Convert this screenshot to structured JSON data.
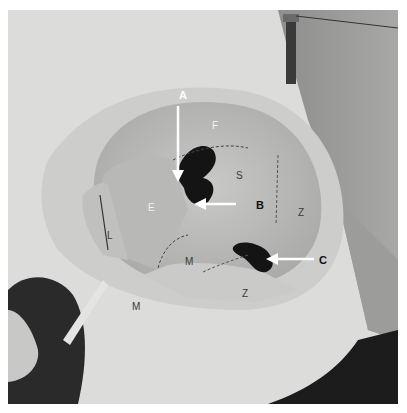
{
  "figure": {
    "arrow_labels": [
      {
        "id": "A",
        "label": "A"
      },
      {
        "id": "B",
        "label": "B"
      },
      {
        "id": "C",
        "label": "C"
      }
    ],
    "bone_labels": {
      "frontal": "F",
      "sphenoid": "S",
      "zygomatic_lateral": "Z",
      "ethmoid": "E",
      "lacrimal": "L",
      "maxilla_floor": "M",
      "zygomatic_floor": "Z",
      "maxilla_face": "M"
    },
    "colors": {
      "bone": "#d8d8d6",
      "shadow": "#1a1a1a",
      "arrow": "#ffffff",
      "background": "#ffffff"
    }
  }
}
